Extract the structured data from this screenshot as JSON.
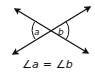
{
  "diagram": {
    "angle_labels": {
      "left": "a",
      "right": "b"
    },
    "equation": {
      "angle_symbol": "∠",
      "left_var": "a",
      "operator": " = ",
      "right_var": "b"
    },
    "colors": {
      "line": "#111111",
      "background": "#ffffff"
    }
  }
}
